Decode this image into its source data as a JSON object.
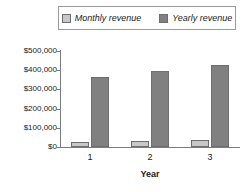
{
  "chart_data": {
    "type": "bar",
    "title": "",
    "xlabel": "Year",
    "ylabel": "",
    "categories": [
      "1",
      "2",
      "3"
    ],
    "series": [
      {
        "name": "Monthly revenue",
        "values": [
          28000,
          32000,
          36000
        ],
        "color": "#c8c8c8"
      },
      {
        "name": "Yearly revenue",
        "values": [
          365000,
          398000,
          428000
        ],
        "color": "#808080"
      }
    ],
    "ylim": [
      0,
      500000
    ],
    "ytick_labels": [
      "$500,000",
      "$400,000",
      "$300,000",
      "$200,000",
      "$100,000",
      "$0"
    ],
    "ytick_values": [
      500000,
      400000,
      300000,
      200000,
      100000,
      0
    ],
    "xtick_labels": [
      "1",
      "2",
      "3"
    ],
    "grid": false,
    "legend_position": "top"
  },
  "legend": {
    "entries": [
      {
        "label": "Monthly revenue",
        "color": "#c8c8c8"
      },
      {
        "label": "Yearly revenue",
        "color": "#808080"
      }
    ]
  },
  "axes": {
    "x_title": "Year"
  }
}
